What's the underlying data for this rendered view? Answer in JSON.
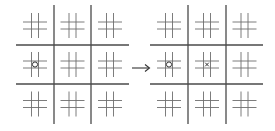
{
  "diagram": {
    "type": "ultimate-tic-tac-toe-move",
    "colors": {
      "background": "#ffffff",
      "major_line": "#4a4a4a",
      "minor_line": "#6e6e6e",
      "mark": "#333333",
      "arrow": "#333333"
    },
    "boards": [
      {
        "id": "before",
        "origin": [
          16,
          5
        ],
        "major_v": [
          54,
          91
        ],
        "major_h": [
          45,
          84
        ],
        "extent": {
          "x0": 16,
          "x1": 129,
          "y0": 5,
          "y1": 124
        },
        "marks": [
          {
            "symbol": "O",
            "board_row": 1,
            "board_col": 0,
            "cell_row": 1,
            "cell_col": 1
          }
        ]
      },
      {
        "id": "after",
        "origin": [
          150,
          5
        ],
        "major_v": [
          188,
          226
        ],
        "major_h": [
          45,
          84
        ],
        "extent": {
          "x0": 150,
          "x1": 263,
          "y0": 5,
          "y1": 124
        },
        "marks": [
          {
            "symbol": "O",
            "board_row": 1,
            "board_col": 0,
            "cell_row": 1,
            "cell_col": 1
          },
          {
            "symbol": "X",
            "board_row": 1,
            "board_col": 1,
            "cell_row": 1,
            "cell_col": 1
          }
        ]
      }
    ],
    "arrow": {
      "from": [
        132,
        68
      ],
      "to": [
        150,
        68
      ],
      "label": "→"
    }
  }
}
